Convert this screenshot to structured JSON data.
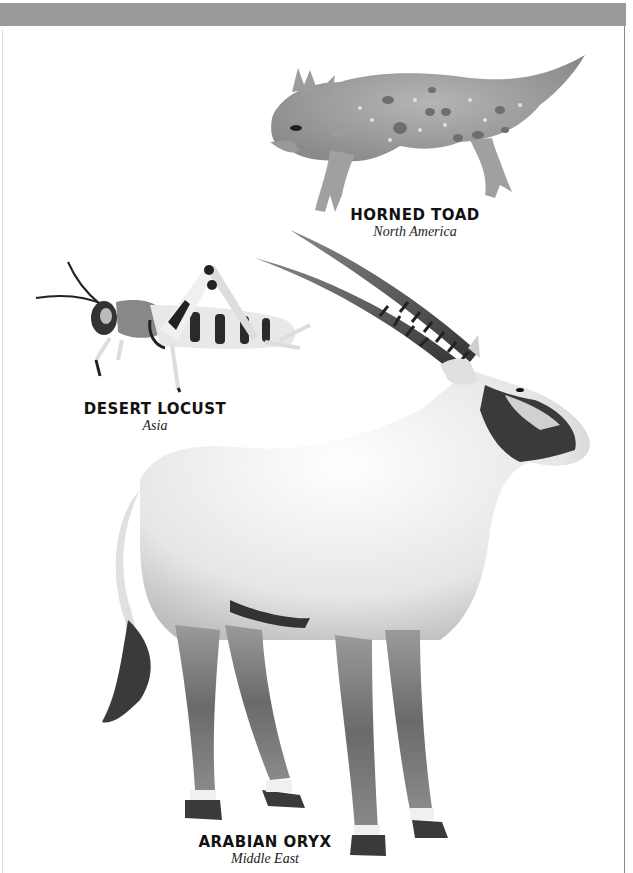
{
  "page": {
    "band_color": "#9a9a9a"
  },
  "animals": [
    {
      "name": "HORNED TOAD",
      "region": "North America",
      "icon": "horned-toad-illustration"
    },
    {
      "name": "DESERT LOCUST",
      "region": "Asia",
      "icon": "desert-locust-illustration"
    },
    {
      "name": "ARABIAN ORYX",
      "region": "Middle East",
      "icon": "arabian-oryx-illustration"
    }
  ]
}
